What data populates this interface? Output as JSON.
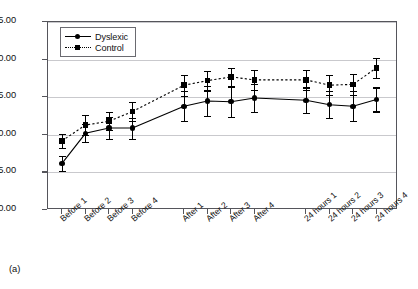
{
  "caption": "(a)",
  "legend": {
    "position": "top-left-inside",
    "entries": [
      {
        "label": "Dyslexic",
        "marker": "circle",
        "line": "solid"
      },
      {
        "label": "Control",
        "marker": "square",
        "line": "dashed"
      }
    ]
  },
  "chart_data": {
    "type": "line",
    "title": "",
    "subtitle": "",
    "xlabel": "",
    "ylabel": "",
    "grid": true,
    "ylim": [
      0,
      25
    ],
    "ytick_labels": [
      "0.00",
      "5.00",
      "10.00",
      "15.00",
      "20.00",
      "25.00"
    ],
    "ytick_values": [
      0,
      5,
      10,
      15,
      20,
      25
    ],
    "categories": [
      "Before 1",
      "Before 2",
      "Before 3",
      "Before 4",
      "After 1",
      "After 2",
      "After 3",
      "After 4",
      "24 hours 1",
      "24 hours 2",
      "24 hours 3",
      "24 hours 4"
    ],
    "series": [
      {
        "name": "Dyslexic",
        "marker": "circle",
        "line": "solid",
        "values": [
          6.2,
          10.2,
          10.9,
          10.9,
          13.8,
          14.5,
          14.4,
          14.9,
          14.6,
          14.0,
          13.8,
          14.7
        ],
        "err_low": [
          1.0,
          1.2,
          1.5,
          1.4,
          2.0,
          2.0,
          2.0,
          1.9,
          1.7,
          1.8,
          2.0,
          1.6
        ],
        "err_high": [
          1.0,
          1.2,
          1.5,
          1.4,
          2.0,
          2.0,
          2.0,
          1.9,
          1.7,
          1.8,
          2.0,
          1.6
        ]
      },
      {
        "name": "Control",
        "marker": "square",
        "line": "dashed",
        "values": [
          9.2,
          11.3,
          11.8,
          13.1,
          16.6,
          17.2,
          17.7,
          17.3,
          17.3,
          16.6,
          16.7,
          18.9
        ],
        "err_low": [
          0.9,
          1.3,
          1.2,
          1.3,
          1.4,
          1.3,
          1.2,
          1.3,
          1.3,
          1.3,
          1.4,
          1.3
        ],
        "err_high": [
          0.9,
          1.3,
          1.2,
          1.3,
          1.4,
          1.3,
          1.2,
          1.3,
          1.3,
          1.3,
          1.4,
          1.3
        ]
      }
    ],
    "colors": {
      "dyslexic": "#000000",
      "control": "#000000",
      "grid": "#c9c9cd",
      "axis": "#55555b"
    }
  }
}
